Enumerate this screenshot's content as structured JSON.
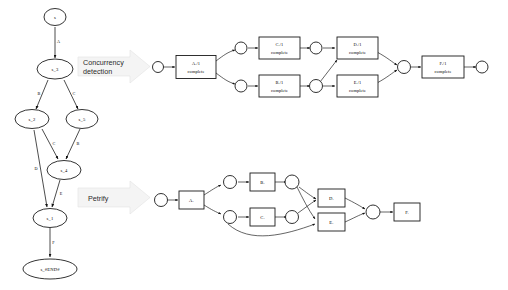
{
  "figure": {
    "background_color": "#ffffff",
    "line_color": "#111111",
    "node_fill": "#ffffff",
    "arrow_block_fill": "#f4f4f4"
  },
  "transition_steps": [
    {
      "label": "Concurrency detection",
      "line1": "Concurrency",
      "line2": "detection"
    },
    {
      "label": "Petrify",
      "line1": "Petrify",
      "line2": ""
    }
  ],
  "transition_system": {
    "name": "transition-system-graph",
    "nodes": [
      {
        "id": "s",
        "label": "s"
      },
      {
        "id": "s_3",
        "label": "s_3"
      },
      {
        "id": "s_2",
        "label": "s_2"
      },
      {
        "id": "s_5",
        "label": "s_5"
      },
      {
        "id": "s_4",
        "label": "s_4"
      },
      {
        "id": "s_1",
        "label": "s_1"
      },
      {
        "id": "s_end",
        "label": "s_#END#"
      }
    ],
    "edges": [
      {
        "from": "s",
        "to": "s_3",
        "label": "A"
      },
      {
        "from": "s_3",
        "to": "s_2",
        "label": "B"
      },
      {
        "from": "s_3",
        "to": "s_5",
        "label": "C"
      },
      {
        "from": "s_2",
        "to": "s_4",
        "label": "C"
      },
      {
        "from": "s_5",
        "to": "s_4",
        "label": "B"
      },
      {
        "from": "s_2",
        "to": "s_1",
        "label": "D"
      },
      {
        "from": "s_4",
        "to": "s_1",
        "label": "E"
      },
      {
        "from": "s_1",
        "to": "s_end",
        "label": "F"
      }
    ]
  },
  "petri_net_top": {
    "name": "petri-net-concurrency",
    "transitions": [
      {
        "id": "t_a",
        "line1": "A./1",
        "line2": "complete"
      },
      {
        "id": "t_c",
        "line1": "C./1",
        "line2": "complete"
      },
      {
        "id": "t_b",
        "line1": "B./1",
        "line2": "complete"
      },
      {
        "id": "t_d",
        "line1": "D./1",
        "line2": "complete"
      },
      {
        "id": "t_e",
        "line1": "E./1",
        "line2": "complete"
      },
      {
        "id": "t_f",
        "line1": "F./1",
        "line2": "complete"
      }
    ],
    "place_count": 7
  },
  "petri_net_bottom": {
    "name": "petri-net-petrify",
    "transitions": [
      {
        "id": "p_a",
        "label": "A."
      },
      {
        "id": "p_b",
        "label": "B."
      },
      {
        "id": "p_c",
        "label": "C."
      },
      {
        "id": "p_d",
        "label": "D."
      },
      {
        "id": "p_e",
        "label": "E."
      },
      {
        "id": "p_f",
        "label": "F."
      }
    ],
    "place_count": 6
  }
}
